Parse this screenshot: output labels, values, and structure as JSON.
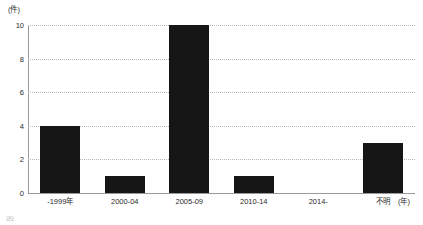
{
  "chart_data": {
    "type": "bar",
    "title": "",
    "subtitle": "",
    "xlabel": "(年)",
    "ylabel": "(件)",
    "categories": [
      "-1999年",
      "2000-04",
      "2005-09",
      "2010-14",
      "2014-",
      "不明"
    ],
    "values": [
      4,
      1,
      10,
      1,
      0,
      3
    ],
    "ylim": [
      0,
      10
    ],
    "yticks": [
      0,
      2,
      4,
      6,
      8,
      10
    ],
    "ytick_labels": [
      "0",
      "2",
      "4",
      "6",
      "8",
      "10"
    ],
    "grid": true,
    "grid_axis": "y",
    "grid_style": "dotted",
    "legend": false,
    "legend_position": "none",
    "bar_color": "#161616",
    "gridline_color": "#b9b9b9",
    "axis_color": "#9a9a9a",
    "background_color": "#ffffff"
  },
  "axes": {
    "y_unit_label": "(件)",
    "x_unit_label": "(年)"
  },
  "caption": {
    "text": "図"
  }
}
